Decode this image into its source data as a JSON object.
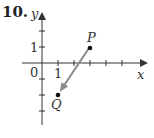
{
  "problem_number": "10.",
  "axes": {
    "x_label": "x",
    "y_label": "y",
    "origin_label": "0",
    "x_tick_label": "1",
    "y_tick_label": "1"
  },
  "points": {
    "P": {
      "label": "P",
      "x": 3,
      "y": 1
    },
    "Q": {
      "label": "Q",
      "x": 1,
      "y": -2
    }
  },
  "vector": {
    "from": "P",
    "to": "Q"
  },
  "colors": {
    "axis": "#333333",
    "vector": "#8a8a8a",
    "point": "#111111"
  }
}
